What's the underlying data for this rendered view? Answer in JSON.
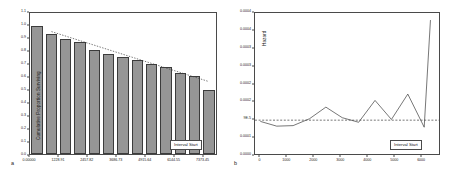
{
  "figure": {
    "panels": [
      {
        "letter": "a",
        "legend_label": "Interval Start",
        "yaxis_title": "Cumulative Proportion Surviving"
      },
      {
        "letter": "b",
        "legend_label": "Interval Start",
        "yaxis_title": "Hazard"
      }
    ]
  },
  "colors": {
    "bar_fill": "#969696",
    "bar_edge": "#3c3c3c",
    "axis": "#4a4a4a",
    "line": "#3c3c3c",
    "text": "#1a1a1a",
    "background": "#ffffff"
  },
  "chart_data": [
    {
      "type": "bar",
      "title": "",
      "panel": "a",
      "xlabel": "Interval Start",
      "ylabel": "Cumulative Proportion Surviving",
      "ylim": [
        0.0,
        1.1
      ],
      "xlim": [
        0.0,
        7987.25
      ],
      "grid": false,
      "legend_position": "bottom-right",
      "ytick_labels": [
        "0.0",
        "0.1",
        "0.2",
        "0.3",
        "0.4",
        "0.5",
        "0.6",
        "0.7",
        "0.8",
        "0.9",
        "1.0",
        "1.1"
      ],
      "ytick_values": [
        0.0,
        0.1,
        0.2,
        0.3,
        0.4,
        0.5,
        0.6,
        0.7,
        0.8,
        0.9,
        1.0,
        1.1
      ],
      "xtick_labels": [
        "0.00000",
        "1228.91",
        "2457.82",
        "3686.73",
        "4915.64",
        "6144.55",
        "7373.45"
      ],
      "xtick_values": [
        0.0,
        1228.91,
        2457.82,
        3686.73,
        4915.64,
        6144.55,
        7373.45
      ],
      "categories": [
        "0.00",
        "614.45",
        "1228.91",
        "1843.36",
        "2457.82",
        "3072.27",
        "3686.73",
        "4301.18",
        "4915.64",
        "5530.09",
        "6144.55",
        "6759.00",
        "7373.45"
      ],
      "values": [
        1.0,
        0.94,
        0.9,
        0.87,
        0.81,
        0.78,
        0.76,
        0.73,
        0.7,
        0.68,
        0.63,
        0.61,
        0.5
      ],
      "overlay": {
        "type": "dotted-trend-line",
        "style": "dotted",
        "x": [
          614.45,
          7373.45
        ],
        "y": [
          0.955,
          0.565
        ]
      }
    },
    {
      "type": "line",
      "title": "",
      "panel": "b",
      "xlabel": "Interval Start",
      "ylabel": "Hazard",
      "ylim": [
        0.0,
        0.0004
      ],
      "xlim": [
        -200,
        6700
      ],
      "grid": false,
      "legend_position": "bottom-right",
      "ytick_labels": [
        "0.0000",
        "0.0001",
        "9E-5",
        "0.0002",
        "0.0002",
        "0.0003",
        "0.0003",
        "0.0004",
        "0.0004"
      ],
      "ytick_values": [
        0.0,
        5e-05,
        0.0001,
        0.00015,
        0.0002,
        0.00025,
        0.0003,
        0.00035,
        0.0004
      ],
      "xtick_labels": [
        "0",
        "1000",
        "2000",
        "3000",
        "4000",
        "5000",
        "6000"
      ],
      "xtick_values": [
        0,
        1000,
        2000,
        3000,
        4000,
        5000,
        6000
      ],
      "x": [
        0,
        614,
        1229,
        1843,
        2458,
        3072,
        3687,
        4301,
        4916,
        5530,
        6145,
        6380
      ],
      "y": [
        9.25e-05,
        7.9e-05,
        8.05e-05,
        0.0001,
        0.000133,
        0.000103,
        9e-05,
        0.000152,
        9.8e-05,
        0.00017,
        7.6e-05,
        0.00038
      ],
      "reference_line": {
        "type": "dashed-horizontal",
        "style": "dashed",
        "y": 9.6e-05
      }
    }
  ]
}
